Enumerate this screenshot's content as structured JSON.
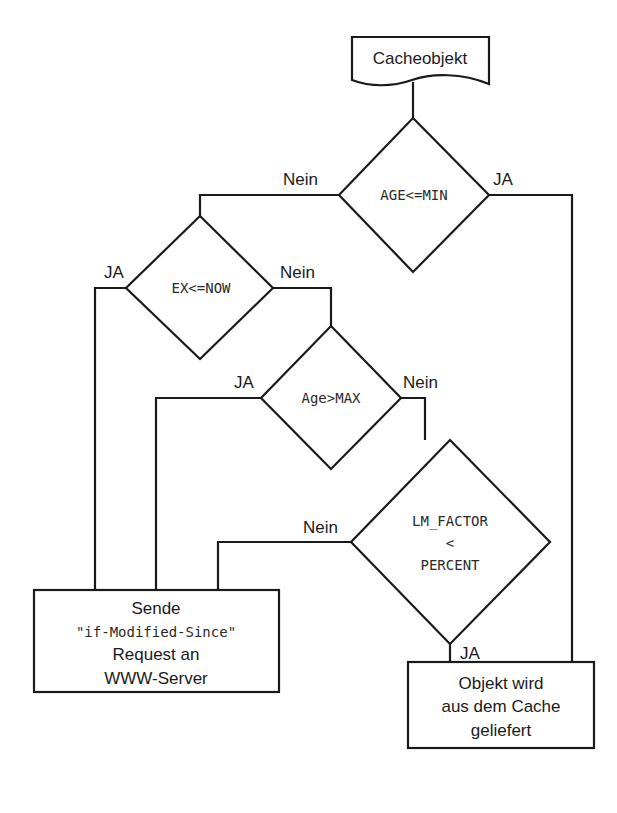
{
  "diagram": {
    "type": "flowchart",
    "start": {
      "label": "Cacheobjekt"
    },
    "decisions": [
      {
        "id": "d1",
        "condition": "AGE<=MIN",
        "yes_label": "JA",
        "no_label": "Nein"
      },
      {
        "id": "d2",
        "condition": "EX<=NOW",
        "yes_label": "JA",
        "no_label": "Nein"
      },
      {
        "id": "d3",
        "condition": "Age>MAX",
        "yes_label": "JA",
        "no_label": "Nein"
      },
      {
        "id": "d4",
        "condition_lines": [
          "LM_FACTOR",
          "<",
          "PERCENT"
        ],
        "yes_label": "JA",
        "no_label": "Nein"
      }
    ],
    "processes": [
      {
        "id": "p1",
        "lines": [
          "Sende",
          "\"if-Modified-Since\"",
          "Request an",
          "WWW-Server"
        ]
      },
      {
        "id": "p2",
        "lines": [
          "Objekt wird",
          "aus dem Cache",
          "geliefert"
        ]
      }
    ]
  }
}
